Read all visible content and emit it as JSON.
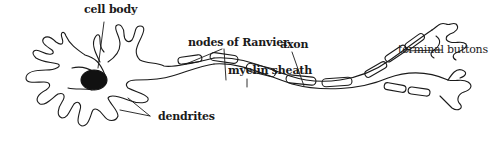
{
  "diagram": {
    "labels": {
      "cell_body": "cell body",
      "dendrites": "dendrites",
      "nodes_of_ranvier": "nodes of Ranvier",
      "myelin_sheath": "myelin sheath",
      "axon": "axon",
      "terminal_buttons": "terminal buttons"
    },
    "colors": {
      "stroke": "#1a1a1a",
      "nucleus": "#111111",
      "background": "#ffffff"
    }
  }
}
